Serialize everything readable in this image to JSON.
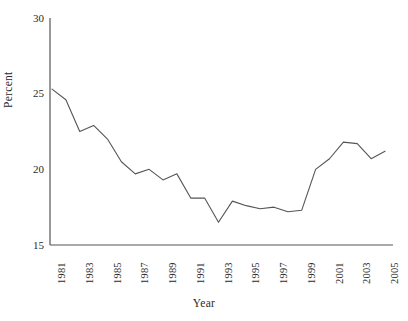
{
  "chart_data": {
    "type": "line",
    "title": "",
    "subtitle": "",
    "xlabel": "Year",
    "ylabel": "Percent",
    "x": [
      1981,
      1982,
      1983,
      1984,
      1985,
      1986,
      1987,
      1988,
      1989,
      1990,
      1991,
      1992,
      1993,
      1994,
      1995,
      1996,
      1997,
      1998,
      1999,
      2000,
      2001,
      2002,
      2003,
      2004,
      2005
    ],
    "values": [
      25.3,
      24.6,
      22.5,
      22.9,
      22.0,
      20.5,
      19.7,
      20.0,
      19.3,
      19.7,
      18.1,
      18.1,
      16.5,
      17.9,
      17.6,
      17.4,
      17.5,
      17.2,
      17.3,
      20.0,
      20.7,
      21.8,
      21.7,
      20.7,
      21.2
    ],
    "series": [
      {
        "name": "Percent",
        "values": [
          25.3,
          24.6,
          22.5,
          22.9,
          22.0,
          20.5,
          19.7,
          20.0,
          19.3,
          19.7,
          18.1,
          18.1,
          16.5,
          17.9,
          17.6,
          17.4,
          17.5,
          17.2,
          17.3,
          20.0,
          20.7,
          21.8,
          21.7,
          20.7,
          21.2
        ],
        "color": "#555555"
      }
    ],
    "xlim": [
      1981,
      2005
    ],
    "ylim": [
      15,
      30
    ],
    "yticks": [
      15,
      20,
      25,
      30
    ],
    "ytick_labels": [
      "15",
      "20",
      "25",
      "30"
    ],
    "xticks": [
      1981,
      1983,
      1985,
      1987,
      1989,
      1991,
      1993,
      1995,
      1997,
      1999,
      2001,
      2003,
      2005
    ],
    "xtick_labels": [
      "1981",
      "1983",
      "1985",
      "1987",
      "1989",
      "1991",
      "1993",
      "1995",
      "1997",
      "1999",
      "2001",
      "2003",
      "2005"
    ],
    "xtick_rotation": -90,
    "grid": false,
    "legend": false,
    "legend_position": "none",
    "line_color": "#555555",
    "axis_color": "#555555",
    "background_color": "#ffffff",
    "markers": false
  }
}
